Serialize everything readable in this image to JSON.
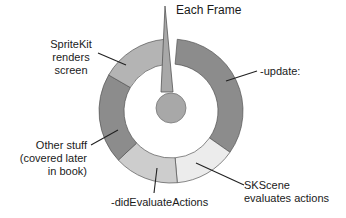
{
  "diagram": {
    "title": "Each Frame",
    "center": {
      "cx": 171,
      "cy": 111
    },
    "outer_radius": 72,
    "inner_radius": 47,
    "hub_radius": 15,
    "colors": {
      "dark": "#8c8c8c",
      "mid": "#b4b4b4",
      "light": "#cdcdcd",
      "lightest": "#ececec",
      "stroke": "#555555",
      "pointer": "#a8a8a8"
    },
    "segments": [
      {
        "name": "update",
        "label_lines": [
          "-update:"
        ],
        "start": 5,
        "end": 125,
        "color": "#8c8c8c"
      },
      {
        "name": "skscene-evaluates-actions",
        "label_lines": [
          "SKScene",
          "evaluates actions"
        ],
        "start": 125,
        "end": 175,
        "color": "#ececec"
      },
      {
        "name": "did-evaluate-actions",
        "label_lines": [
          "-didEvaluateActions"
        ],
        "start": 175,
        "end": 227,
        "color": "#cdcdcd"
      },
      {
        "name": "other-stuff",
        "label_lines": [
          "Other stuff",
          "(covered later",
          "in book)"
        ],
        "start": 227,
        "end": 300,
        "color": "#8c8c8c"
      },
      {
        "name": "spritekit-renders-screen",
        "label_lines": [
          "SpriteKit",
          "renders",
          "screen"
        ],
        "start": 300,
        "end": 355,
        "color": "#b4b4b4"
      }
    ],
    "labels": {
      "each_frame": "Each Frame",
      "update": "-update:",
      "skscene_1": "SKScene",
      "skscene_2": "evaluates actions",
      "did_eval": "-didEvaluateActions",
      "other_1": "Other stuff",
      "other_2": "(covered later",
      "other_3": "in book)",
      "render_1": "SpriteKit",
      "render_2": "renders",
      "render_3": "screen"
    }
  }
}
